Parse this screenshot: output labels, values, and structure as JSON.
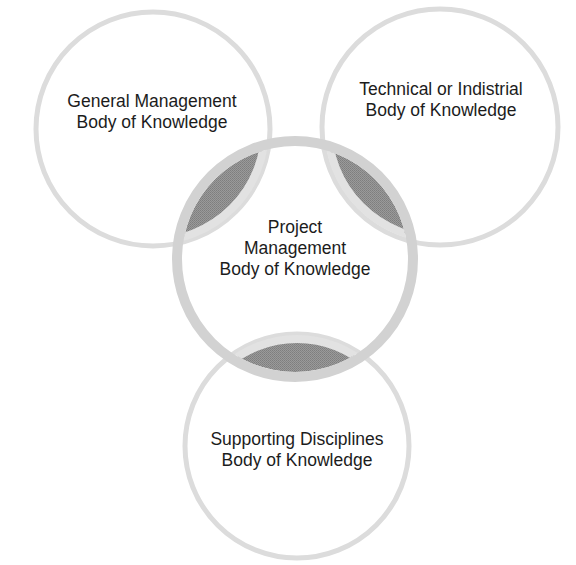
{
  "diagram": {
    "type": "venn-overlap",
    "colors": {
      "background": "#ffffff",
      "outer_stroke": "#dcdcdc",
      "center_stroke": "#d2d2d2",
      "overlap_fill": "#8e8e8e",
      "text": "#1c1c1c"
    },
    "circles": [
      {
        "id": "general",
        "lines": [
          "General Management",
          "Body of Knowledge"
        ]
      },
      {
        "id": "technical",
        "lines": [
          "Technical or Indistrial",
          "Body of Knowledge"
        ]
      },
      {
        "id": "project",
        "lines": [
          "Project",
          "Management",
          "Body of Knowledge"
        ]
      },
      {
        "id": "supporting",
        "lines": [
          "Supporting Disciplines",
          "Body of Knowledge"
        ]
      }
    ]
  }
}
